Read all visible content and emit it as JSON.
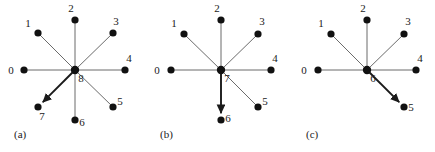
{
  "figure": {
    "background_color": "#ffffff",
    "node_color": "#111111",
    "edge_color": "#6b6b6b",
    "highlight_edge_color": "#1a1a1a",
    "label_color": "#1a1a1a",
    "node_radius": 3.6,
    "panels": [
      {
        "caption": "(a)",
        "caption_x": 14,
        "caption_y": 138,
        "center": {
          "label": "8",
          "x": 75,
          "y": 70,
          "label_x": 81,
          "label_y": 82
        },
        "nodes": [
          {
            "label": "0",
            "x": 24,
            "y": 70,
            "label_x": 11,
            "label_y": 74,
            "highlight": false
          },
          {
            "label": "1",
            "x": 38,
            "y": 33,
            "label_x": 28,
            "label_y": 27,
            "highlight": false
          },
          {
            "label": "2",
            "x": 75,
            "y": 20,
            "label_x": 71,
            "label_y": 12,
            "highlight": false
          },
          {
            "label": "3",
            "x": 113,
            "y": 33,
            "label_x": 116,
            "label_y": 25,
            "highlight": false
          },
          {
            "label": "4",
            "x": 125,
            "y": 70,
            "label_x": 129,
            "label_y": 62,
            "highlight": false
          },
          {
            "label": "5",
            "x": 113,
            "y": 107,
            "label_x": 120,
            "label_y": 105,
            "highlight": false
          },
          {
            "label": "6",
            "x": 75,
            "y": 120,
            "label_x": 82,
            "label_y": 126,
            "highlight": false
          },
          {
            "label": "7",
            "x": 38,
            "y": 107,
            "label_x": 42,
            "label_y": 120,
            "highlight": true
          }
        ]
      },
      {
        "caption": "(b)",
        "caption_x": 160,
        "caption_y": 138,
        "center": {
          "label": "7",
          "x": 221,
          "y": 70,
          "label_x": 227,
          "label_y": 82
        },
        "nodes": [
          {
            "label": "0",
            "x": 171,
            "y": 70,
            "label_x": 157,
            "label_y": 74,
            "highlight": false
          },
          {
            "label": "1",
            "x": 184,
            "y": 34,
            "label_x": 174,
            "label_y": 27,
            "highlight": false
          },
          {
            "label": "2",
            "x": 221,
            "y": 20,
            "label_x": 217,
            "label_y": 12,
            "highlight": false
          },
          {
            "label": "3",
            "x": 258,
            "y": 34,
            "label_x": 262,
            "label_y": 25,
            "highlight": false
          },
          {
            "label": "4",
            "x": 271,
            "y": 70,
            "label_x": 275,
            "label_y": 62,
            "highlight": false
          },
          {
            "label": "5",
            "x": 258,
            "y": 107,
            "label_x": 265,
            "label_y": 105,
            "highlight": false
          },
          {
            "label": "6",
            "x": 221,
            "y": 120,
            "label_x": 228,
            "label_y": 122,
            "highlight": true
          }
        ]
      },
      {
        "caption": "(c)",
        "caption_x": 306,
        "caption_y": 138,
        "center": {
          "label": "6",
          "x": 367,
          "y": 70,
          "label_x": 373,
          "label_y": 82
        },
        "nodes": [
          {
            "label": "0",
            "x": 318,
            "y": 70,
            "label_x": 304,
            "label_y": 74,
            "highlight": false
          },
          {
            "label": "1",
            "x": 331,
            "y": 34,
            "label_x": 321,
            "label_y": 27,
            "highlight": false
          },
          {
            "label": "2",
            "x": 367,
            "y": 20,
            "label_x": 363,
            "label_y": 12,
            "highlight": false
          },
          {
            "label": "3",
            "x": 404,
            "y": 34,
            "label_x": 408,
            "label_y": 25,
            "highlight": false
          },
          {
            "label": "4",
            "x": 416,
            "y": 70,
            "label_x": 420,
            "label_y": 62,
            "highlight": false
          },
          {
            "label": "5",
            "x": 404,
            "y": 107,
            "label_x": 411,
            "label_y": 111,
            "highlight": true
          }
        ]
      }
    ]
  }
}
